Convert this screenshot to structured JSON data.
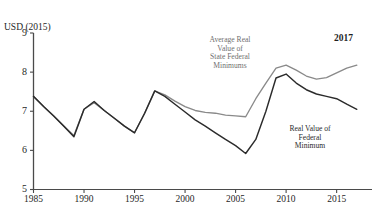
{
  "top_caption": "",
  "axis": {
    "y_title": "USD (2015)",
    "y_ticks": [
      "9",
      "8",
      "7",
      "6",
      "5"
    ],
    "y_min": 5,
    "y_max": 9,
    "x_ticks": [
      "1985",
      "1990",
      "1995",
      "2000",
      "2005",
      "2010",
      "2015"
    ],
    "x_min": 1985,
    "x_max": 2018.5
  },
  "annotations": {
    "state_federal": "Average Real\nValue of\nState Federal\nMinimums",
    "state_federal_lines": [
      "Average Real",
      "Value of",
      "State Federal",
      "Minimums"
    ],
    "federal": "Real Value of\nFederal\nMinimum",
    "federal_lines": [
      "Real Value of",
      "Federal",
      "Minimum"
    ],
    "end_year": "2017"
  },
  "colors": {
    "state_federal_line": "#8a8a8a",
    "federal_line": "#2b2b2b",
    "axis": "#4a4a4a",
    "background": "#ffffff"
  },
  "chart_data": {
    "type": "line",
    "title": "",
    "xlabel": "",
    "ylabel": "USD (2015)",
    "xlim": [
      1985,
      2018.5
    ],
    "ylim": [
      5,
      9
    ],
    "grid": false,
    "legend": "annotations-inline",
    "x": [
      1985,
      1986,
      1987,
      1988,
      1989,
      1990,
      1991,
      1992,
      1993,
      1994,
      1995,
      1996,
      1997,
      1998,
      1999,
      2000,
      2001,
      2002,
      2003,
      2004,
      2005,
      2006,
      2007,
      2008,
      2009,
      2010,
      2011,
      2012,
      2013,
      2014,
      2015,
      2016,
      2017
    ],
    "series": [
      {
        "name": "Average Real Value of State Federal Minimums",
        "color": "#8a8a8a",
        "values": [
          7.38,
          7.12,
          6.88,
          6.62,
          6.38,
          7.05,
          7.22,
          7.02,
          6.82,
          6.62,
          6.45,
          6.95,
          7.52,
          7.42,
          7.26,
          7.12,
          7.02,
          6.97,
          6.95,
          6.9,
          6.88,
          6.86,
          7.32,
          7.72,
          8.1,
          8.18,
          8.05,
          7.9,
          7.82,
          7.86,
          7.98,
          8.1,
          8.18
        ]
      },
      {
        "name": "Real Value of Federal Minimum",
        "color": "#2b2b2b",
        "values": [
          7.38,
          7.12,
          6.88,
          6.62,
          6.35,
          7.05,
          7.25,
          7.02,
          6.82,
          6.62,
          6.45,
          6.95,
          7.52,
          7.38,
          7.18,
          6.98,
          6.78,
          6.62,
          6.45,
          6.28,
          6.12,
          5.92,
          6.28,
          7.0,
          7.85,
          7.95,
          7.72,
          7.55,
          7.44,
          7.38,
          7.32,
          7.18,
          7.05
        ]
      }
    ]
  }
}
